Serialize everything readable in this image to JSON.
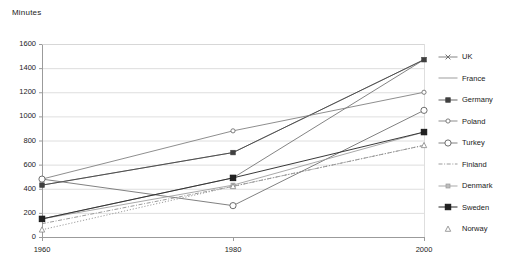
{
  "chart_data": {
    "type": "line",
    "title": "",
    "ylabel": "Minutes",
    "xlabel": "",
    "categories": [
      "1960",
      "1980",
      "2000"
    ],
    "x": [
      1960,
      1980,
      2000
    ],
    "ylim": [
      0,
      1600
    ],
    "ytick_step": 200,
    "yticks": [
      "0",
      "200",
      "400",
      "600",
      "800",
      "1000",
      "1200",
      "1400",
      "1600"
    ],
    "ytick_values": [
      0,
      200,
      400,
      600,
      800,
      1000,
      1200,
      1400,
      1600
    ],
    "grid": "horizontal",
    "legend_position": "right",
    "series": [
      {
        "name": "UK",
        "values": [
          150,
          490,
          1470
        ],
        "marker": "x",
        "color": "#6e6e6e",
        "dash": "none"
      },
      {
        "name": "France",
        "values": [
          430,
          700,
          1470
        ],
        "marker": "none",
        "color": "#8c8c8c",
        "dash": "none"
      },
      {
        "name": "Germany",
        "values": [
          430,
          700,
          1470
        ],
        "marker": "square-filled",
        "color": "#4a4a4a",
        "dash": "none"
      },
      {
        "name": "Poland",
        "values": [
          480,
          880,
          1200
        ],
        "marker": "circle-small",
        "color": "#7a7a7a",
        "dash": "none"
      },
      {
        "name": "Turkey",
        "values": [
          480,
          260,
          1050
        ],
        "marker": "circle-open",
        "color": "#6a6a6a",
        "dash": "none"
      },
      {
        "name": "Finland",
        "values": [
          110,
          420,
          760
        ],
        "marker": "none",
        "color": "#8a8a8a",
        "dash": "dashdot"
      },
      {
        "name": "Denmark",
        "values": [
          150,
          430,
          870
        ],
        "marker": "square-light",
        "color": "#9a9a9a",
        "dash": "none"
      },
      {
        "name": "Sweden",
        "values": [
          150,
          490,
          870
        ],
        "marker": "square-bold",
        "color": "#2e2e2e",
        "dash": "none"
      },
      {
        "name": "Norway",
        "values": [
          60,
          420,
          760
        ],
        "marker": "triangle-open",
        "color": "#8a8a8a",
        "dash": "dotted"
      }
    ]
  },
  "legend": {
    "items": [
      {
        "label": "UK"
      },
      {
        "label": "France"
      },
      {
        "label": "Germany"
      },
      {
        "label": "Poland"
      },
      {
        "label": "Turkey"
      },
      {
        "label": "Finland"
      },
      {
        "label": "Denmark"
      },
      {
        "label": "Sweden"
      },
      {
        "label": "Norway"
      }
    ]
  },
  "caption": ""
}
